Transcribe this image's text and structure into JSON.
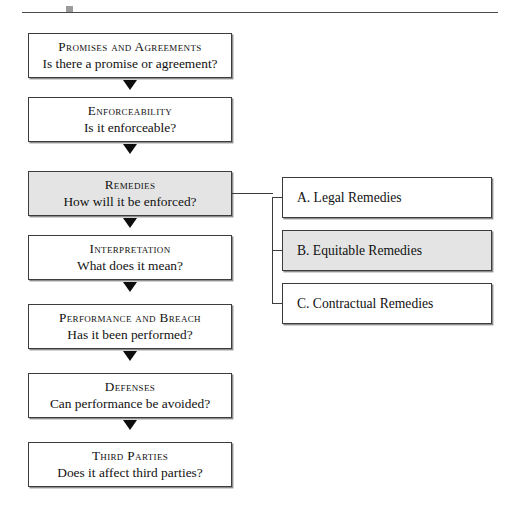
{
  "page": {
    "background_color": "#ffffff",
    "shaded_box_color": "#e4e4e4",
    "border_color": "#3c3c3c",
    "text_color": "#111111",
    "header_rule_present": true
  },
  "flow": {
    "steps": [
      {
        "id": "promises-and-agreements",
        "title": "Promises and Agreements",
        "question": "Is there a promise or agreement?",
        "shaded": false
      },
      {
        "id": "enforceability",
        "title": "Enforceability",
        "question": "Is it enforceable?",
        "shaded": false
      },
      {
        "id": "remedies",
        "title": "Remedies",
        "question": "How will it be enforced?",
        "shaded": true
      },
      {
        "id": "interpretation",
        "title": "Interpretation",
        "question": "What does it mean?",
        "shaded": false
      },
      {
        "id": "performance-and-breach",
        "title": "Performance and Breach",
        "question": "Has it been performed?",
        "shaded": false
      },
      {
        "id": "defenses",
        "title": "Defenses",
        "question": "Can performance be avoided?",
        "shaded": false
      },
      {
        "id": "third-parties",
        "title": "Third Parties",
        "question": "Does it affect third parties?",
        "shaded": false
      }
    ]
  },
  "branches": {
    "parent": "remedies",
    "items": [
      {
        "id": "legal-remedies",
        "label": "A.  Legal Remedies",
        "shaded": false
      },
      {
        "id": "equitable-remedies",
        "label": "B.  Equitable Remedies",
        "shaded": true
      },
      {
        "id": "contractual-remedies",
        "label": "C.  Contractual Remedies",
        "shaded": false
      }
    ]
  },
  "connectors": {
    "arrow_glyph": "triangle-down",
    "arrow_count": 6,
    "bracket_style": "square"
  }
}
